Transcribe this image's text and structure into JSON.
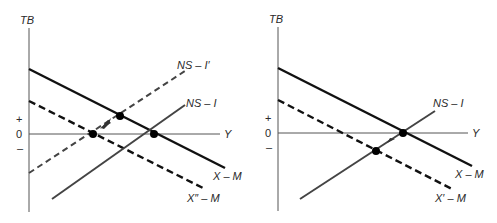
{
  "panels": [
    {
      "id": "left",
      "y_axis_label": "TB",
      "x_axis_label": "Y",
      "ticks": {
        "plus": "+",
        "zero": "0",
        "minus": "–"
      },
      "curves": [
        {
          "label": "X – M",
          "style": "solid"
        },
        {
          "label": "X″ – M",
          "style": "dashed"
        },
        {
          "label": "NS – I",
          "style": "solid"
        },
        {
          "label": "NS – I′",
          "style": "dashed"
        }
      ],
      "equilibrium_points": 3,
      "arrow": "shift along NS – I′ toward new equilibrium at TB = 0"
    },
    {
      "id": "right",
      "y_axis_label": "TB",
      "x_axis_label": "Y",
      "ticks": {
        "plus": "+",
        "zero": "0",
        "minus": "–"
      },
      "curves": [
        {
          "label": "X – M",
          "style": "solid"
        },
        {
          "label": "X′ – M",
          "style": "dashed"
        },
        {
          "label": "NS – I",
          "style": "solid"
        }
      ],
      "equilibrium_points": 2,
      "arrow": "movement along NS – I toward equilibrium at TB = 0"
    }
  ],
  "left": {
    "tb": "TB",
    "y": "Y",
    "plus": "+",
    "zero": "0",
    "minus": "–",
    "xm": "X – M",
    "xdm": "X″ – M",
    "nsi": "NS – I",
    "nsip": "NS – I′"
  },
  "right": {
    "tb": "TB",
    "y": "Y",
    "plus": "+",
    "zero": "0",
    "minus": "–",
    "xm": "X – M",
    "xpm": "X′ – M",
    "nsi": "NS – I"
  }
}
